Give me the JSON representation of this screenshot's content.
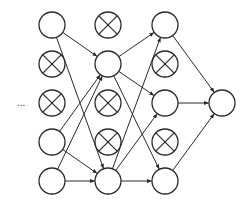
{
  "diagram": {
    "title": "",
    "type": "neural-network-dropout",
    "ellipsis_label": "...",
    "colors": {
      "stroke": "#2a2a2a",
      "fill": "#ffffff",
      "background": "#ffffff"
    },
    "node_radius": 13,
    "nodes": [
      {
        "id": "c1r0",
        "col": 1,
        "x": 52,
        "y": 25,
        "dropped": false
      },
      {
        "id": "c1r1",
        "col": 1,
        "x": 52,
        "y": 64,
        "dropped": true
      },
      {
        "id": "c1r2",
        "col": 1,
        "x": 52,
        "y": 103,
        "dropped": true
      },
      {
        "id": "c1r3",
        "col": 1,
        "x": 52,
        "y": 142,
        "dropped": false
      },
      {
        "id": "c1r4",
        "col": 1,
        "x": 52,
        "y": 181,
        "dropped": false
      },
      {
        "id": "c2r0",
        "col": 2,
        "x": 108,
        "y": 25,
        "dropped": true
      },
      {
        "id": "c2r1",
        "col": 2,
        "x": 108,
        "y": 64,
        "dropped": false
      },
      {
        "id": "c2r2",
        "col": 2,
        "x": 108,
        "y": 103,
        "dropped": true
      },
      {
        "id": "c2r3",
        "col": 2,
        "x": 108,
        "y": 142,
        "dropped": true
      },
      {
        "id": "c2r4",
        "col": 2,
        "x": 108,
        "y": 181,
        "dropped": false
      },
      {
        "id": "c3r0",
        "col": 3,
        "x": 165,
        "y": 25,
        "dropped": false
      },
      {
        "id": "c3r1",
        "col": 3,
        "x": 165,
        "y": 64,
        "dropped": true
      },
      {
        "id": "c3r2",
        "col": 3,
        "x": 165,
        "y": 103,
        "dropped": false
      },
      {
        "id": "c3r3",
        "col": 3,
        "x": 165,
        "y": 142,
        "dropped": true
      },
      {
        "id": "c3r4",
        "col": 3,
        "x": 165,
        "y": 181,
        "dropped": false
      },
      {
        "id": "c4r0",
        "col": 4,
        "x": 222,
        "y": 103,
        "dropped": false
      }
    ],
    "edges": [
      [
        "c1r0",
        "c2r1"
      ],
      [
        "c1r0",
        "c2r4"
      ],
      [
        "c1r3",
        "c2r1"
      ],
      [
        "c1r3",
        "c2r4"
      ],
      [
        "c1r4",
        "c2r1"
      ],
      [
        "c1r4",
        "c2r4"
      ],
      [
        "c2r1",
        "c3r0"
      ],
      [
        "c2r1",
        "c3r2"
      ],
      [
        "c2r1",
        "c3r4"
      ],
      [
        "c2r4",
        "c3r0"
      ],
      [
        "c2r4",
        "c3r2"
      ],
      [
        "c2r4",
        "c3r4"
      ],
      [
        "c3r0",
        "c4r0"
      ],
      [
        "c3r2",
        "c4r0"
      ],
      [
        "c3r4",
        "c4r0"
      ]
    ]
  }
}
